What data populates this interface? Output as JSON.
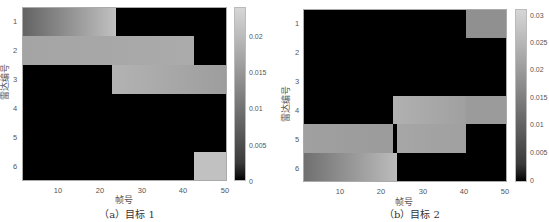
{
  "chart_data": [
    {
      "type": "heatmap",
      "title": "",
      "caption": "（a）目标 1",
      "xlabel": "帧号",
      "ylabel": "雷达编号",
      "x_ticks": [
        "10",
        "20",
        "30",
        "40",
        "50"
      ],
      "y_ticks": [
        "1",
        "2",
        "3",
        "4",
        "5",
        "6"
      ],
      "xlim": [
        1,
        50
      ],
      "colorbar": {
        "ticks": [
          "0",
          "0.005",
          "0.01",
          "0.015",
          "0.02"
        ],
        "range": [
          0,
          0.024
        ]
      },
      "segments": [
        {
          "radar": 1,
          "frame_start": 1,
          "frame_end": 23,
          "value_start": 0.008,
          "value_end": 0.021
        },
        {
          "radar": 2,
          "frame_start": 1,
          "frame_end": 42,
          "value_start": 0.017,
          "value_end": 0.018
        },
        {
          "radar": 3,
          "frame_start": 23,
          "frame_end": 50,
          "value_start": 0.019,
          "value_end": 0.016
        },
        {
          "radar": 6,
          "frame_start": 43,
          "frame_end": 50,
          "value_start": 0.021,
          "value_end": 0.021
        }
      ]
    },
    {
      "type": "heatmap",
      "title": "",
      "caption": "（b）目标 2",
      "xlabel": "帧号",
      "ylabel": "雷达编号",
      "x_ticks": [
        "10",
        "20",
        "30",
        "40",
        "50"
      ],
      "y_ticks": [
        "1",
        "2",
        "3",
        "4",
        "5",
        "6"
      ],
      "xlim": [
        1,
        50
      ],
      "colorbar": {
        "ticks": [
          "0",
          "0.005",
          "0.01",
          "0.015",
          "0.02",
          "0.025",
          "0.03"
        ],
        "range": [
          0,
          0.032
        ]
      },
      "segments": [
        {
          "radar": 1,
          "frame_start": 41,
          "frame_end": 50,
          "value_start": 0.019,
          "value_end": 0.019
        },
        {
          "radar": 4,
          "frame_start": 23,
          "frame_end": 40,
          "value_start": 0.025,
          "value_end": 0.022
        },
        {
          "radar": 4,
          "frame_start": 41,
          "frame_end": 50,
          "value_start": 0.021,
          "value_end": 0.021
        },
        {
          "radar": 5,
          "frame_start": 1,
          "frame_end": 22,
          "value_start": 0.022,
          "value_end": 0.021
        },
        {
          "radar": 5,
          "frame_start": 24,
          "frame_end": 40,
          "value_start": 0.023,
          "value_end": 0.022
        },
        {
          "radar": 6,
          "frame_start": 1,
          "frame_end": 23,
          "value_start": 0.013,
          "value_end": 0.027
        }
      ]
    }
  ],
  "panels": {
    "a": {
      "caption": "（a）目标 1",
      "xlabel": "帧号",
      "ylabel": "雷达编号",
      "yticks": [
        "1",
        "2",
        "3",
        "4",
        "5",
        "6"
      ],
      "xticks": [
        "10",
        "20",
        "30",
        "40",
        "50"
      ],
      "cbar_ticks": [
        "0.02",
        "0.015",
        "0.01",
        "0.005",
        "0"
      ]
    },
    "b": {
      "caption": "（b）目标 2",
      "xlabel": "帧号",
      "ylabel": "雷达编号",
      "yticks": [
        "1",
        "2",
        "3",
        "4",
        "5",
        "6"
      ],
      "xticks": [
        "10",
        "20",
        "30",
        "40",
        "50"
      ],
      "cbar_ticks": [
        "0.03",
        "0.025",
        "0.02",
        "0.015",
        "0.01",
        "0.005",
        "0"
      ]
    }
  }
}
